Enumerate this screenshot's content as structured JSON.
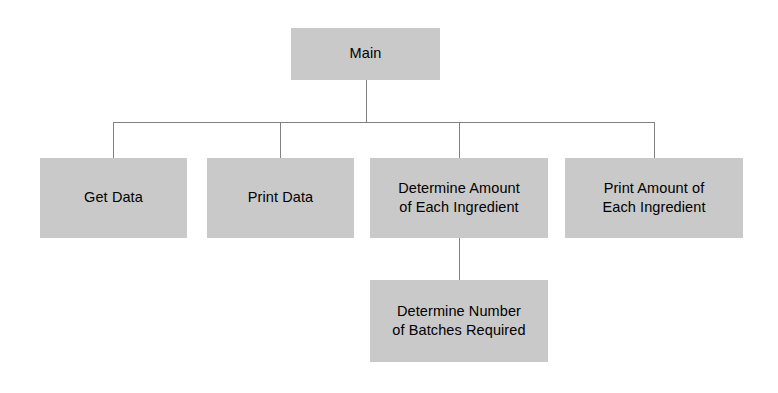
{
  "diagram": {
    "type": "structure-chart",
    "title": "",
    "colors": {
      "box_fill": "#c9c9c9",
      "connector": "#808080",
      "text": "#000000",
      "background": "#ffffff"
    },
    "nodes": [
      {
        "id": "main",
        "label": "Main",
        "level": 0,
        "x": 291,
        "y": 28,
        "width": 149,
        "height": 52
      },
      {
        "id": "get-data",
        "label": "Get Data",
        "level": 1,
        "x": 40,
        "y": 158,
        "width": 147,
        "height": 80
      },
      {
        "id": "print-data",
        "label": "Print Data",
        "level": 1,
        "x": 207,
        "y": 158,
        "width": 147,
        "height": 80
      },
      {
        "id": "determine-amount",
        "label": "Determine Amount\nof Each Ingredient",
        "level": 1,
        "x": 370,
        "y": 158,
        "width": 178,
        "height": 80
      },
      {
        "id": "print-amount",
        "label": "Print Amount of\nEach Ingredient",
        "level": 1,
        "x": 565,
        "y": 158,
        "width": 178,
        "height": 80
      },
      {
        "id": "determine-batches",
        "label": "Determine Number\nof Batches Required",
        "level": 2,
        "x": 370,
        "y": 280,
        "width": 178,
        "height": 82
      }
    ],
    "connectors": {
      "main_stem": {
        "x": 366,
        "y1": 80,
        "y2": 122
      },
      "bus": {
        "y": 122,
        "x1": 113,
        "x2": 654
      },
      "drops": [
        {
          "to": "get-data",
          "x": 113,
          "y1": 122,
          "y2": 158
        },
        {
          "to": "print-data",
          "x": 280,
          "y1": 122,
          "y2": 158
        },
        {
          "to": "determine-amount",
          "x": 459,
          "y1": 122,
          "y2": 158
        },
        {
          "to": "print-amount",
          "x": 654,
          "y1": 122,
          "y2": 158
        }
      ],
      "sub_stem": {
        "from": "determine-amount",
        "to": "determine-batches",
        "x": 459,
        "y1": 238,
        "y2": 280
      }
    }
  }
}
